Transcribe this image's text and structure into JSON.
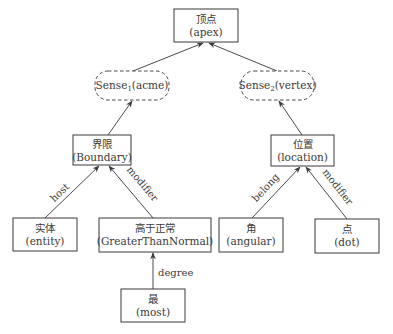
{
  "diagram": {
    "title": "",
    "nodes": [
      {
        "id": "apex",
        "line1": "顶点",
        "line2": "(apex)",
        "style": "solid",
        "x": 174,
        "y": 9,
        "w": 64,
        "h": 33
      },
      {
        "id": "sense1",
        "line1": "Sense",
        "sub": "1",
        "line1_suffix": "(acme)",
        "style": "dashed",
        "x": 95,
        "y": 71,
        "w": 74,
        "h": 29
      },
      {
        "id": "sense2",
        "line1": "Sense",
        "sub": "2",
        "line1_suffix": "(vertex)",
        "style": "dashed",
        "x": 241,
        "y": 71,
        "w": 73,
        "h": 29
      },
      {
        "id": "boundary",
        "line1": "界限",
        "line2": "(Boundary)",
        "style": "solid",
        "x": 73,
        "y": 135,
        "w": 58,
        "h": 30
      },
      {
        "id": "location",
        "line1": "位置",
        "line2": "(location)",
        "style": "solid",
        "x": 271,
        "y": 135,
        "w": 63,
        "h": 31
      },
      {
        "id": "entity",
        "line1": "实体",
        "line2": "(entity)",
        "style": "solid",
        "x": 13,
        "y": 218,
        "w": 64,
        "h": 33
      },
      {
        "id": "gtn",
        "line1": "高于正常",
        "line2": "(GreaterThanNormal)",
        "style": "solid",
        "x": 99,
        "y": 218,
        "w": 112,
        "h": 34
      },
      {
        "id": "angular",
        "line1": "角",
        "line2": "(angular)",
        "style": "solid",
        "x": 219,
        "y": 218,
        "w": 64,
        "h": 34
      },
      {
        "id": "dot",
        "line1": "点",
        "line2": "(dot)",
        "style": "solid",
        "x": 315,
        "y": 219,
        "w": 64,
        "h": 34
      },
      {
        "id": "most",
        "line1": "最",
        "line2": "(most)",
        "style": "solid",
        "x": 121,
        "y": 289,
        "w": 64,
        "h": 33
      }
    ],
    "edges": [
      {
        "id": "sense1-apex",
        "from": "sense1",
        "to": "apex",
        "label": "",
        "x1": 133,
        "y1": 71,
        "x2": 203,
        "y2": 43
      },
      {
        "id": "sense2-apex",
        "from": "sense2",
        "to": "apex",
        "label": "",
        "x1": 277,
        "y1": 71,
        "x2": 209,
        "y2": 43
      },
      {
        "id": "boundary-sense1",
        "from": "boundary",
        "to": "sense1",
        "label": "",
        "x1": 108,
        "y1": 135,
        "x2": 132,
        "y2": 101
      },
      {
        "id": "location-sense2",
        "from": "location",
        "to": "sense2",
        "label": "",
        "x1": 302,
        "y1": 135,
        "x2": 279,
        "y2": 101
      },
      {
        "id": "entity-boundary",
        "from": "entity",
        "to": "boundary",
        "label": "host",
        "x1": 45,
        "y1": 218,
        "x2": 99,
        "y2": 166
      },
      {
        "id": "gtn-boundary",
        "from": "gtn",
        "to": "boundary",
        "label": "modifier",
        "x1": 153,
        "y1": 218,
        "x2": 109,
        "y2": 166
      },
      {
        "id": "angular-location",
        "from": "angular",
        "to": "location",
        "label": "belong",
        "x1": 252,
        "y1": 218,
        "x2": 300,
        "y2": 167
      },
      {
        "id": "dot-location",
        "from": "dot",
        "to": "location",
        "label": "modifier",
        "x1": 347,
        "y1": 219,
        "x2": 306,
        "y2": 167
      },
      {
        "id": "most-gtn",
        "from": "most",
        "to": "gtn",
        "label": "degree",
        "x1": 153,
        "y1": 289,
        "x2": 153,
        "y2": 253
      }
    ],
    "colors": {
      "stroke": "#3a3a3a",
      "text": "#3a3a3a",
      "background": "#ffffff"
    }
  }
}
